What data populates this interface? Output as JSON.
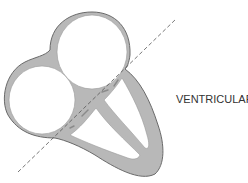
{
  "diagram": {
    "labels": {
      "ventricular": "VENTRICULAR"
    },
    "colors": {
      "wall_fill": "#b8b8b8",
      "wall_stroke": "#6a6a6a",
      "chamber_fill": "#ffffff",
      "dashed_line": "#555555",
      "label_text": "#333333"
    },
    "elements": [
      "right-atrium",
      "left-atrium",
      "ventricle-wall",
      "interventricular-septum",
      "valve-leaflets",
      "dashed-plane-line"
    ]
  }
}
